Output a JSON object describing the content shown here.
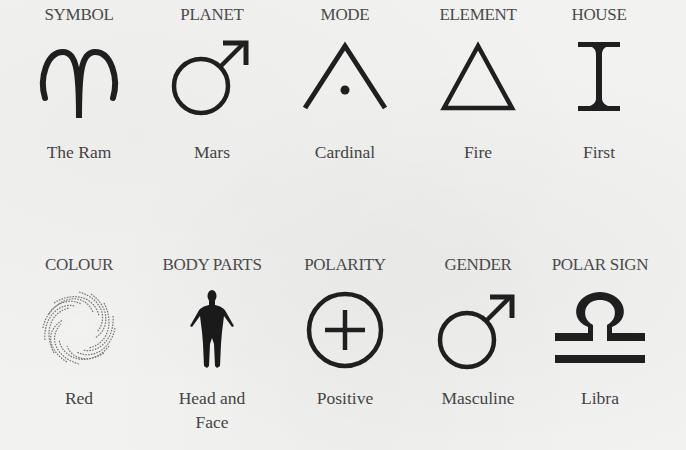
{
  "page": {
    "background": "#f2f2f1",
    "ink": "#1f1f1f",
    "text_color": "#444444"
  },
  "rows": [
    {
      "cells": [
        {
          "header": "SYMBOL",
          "icon": "aries-ram-icon",
          "label": "The Ram"
        },
        {
          "header": "PLANET",
          "icon": "mars-icon",
          "label": "Mars"
        },
        {
          "header": "MODE",
          "icon": "cardinal-mode-icon",
          "label": "Cardinal"
        },
        {
          "header": "ELEMENT",
          "icon": "fire-triangle-icon",
          "label": "Fire"
        },
        {
          "header": "HOUSE",
          "icon": "roman-numeral-one-icon",
          "label": "First"
        }
      ]
    },
    {
      "cells": [
        {
          "header": "COLOUR",
          "icon": "color-swirl-icon",
          "label": "Red"
        },
        {
          "header": "BODY PARTS",
          "icon": "human-figure-icon",
          "label_lines": [
            "Head and",
            "Face"
          ]
        },
        {
          "header": "POLARITY",
          "icon": "circled-plus-icon",
          "label": "Positive"
        },
        {
          "header": "GENDER",
          "icon": "male-symbol-icon",
          "label": "Masculine"
        },
        {
          "header": "POLAR SIGN",
          "icon": "libra-icon",
          "label": "Libra"
        }
      ]
    }
  ]
}
